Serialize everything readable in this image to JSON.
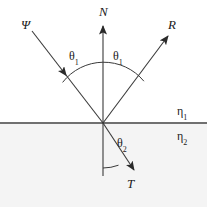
{
  "figure": {
    "background_color": "#ffffff",
    "lower_medium_fill": "#f4f4f4",
    "line_color": "#3a3a3a",
    "interface_color": "#707070",
    "text_color": "#1a1a1a",
    "width": 207,
    "height": 207
  },
  "labels": {
    "incident_ray": "Ψ",
    "normal": "N",
    "reflected_ray": "R",
    "transmitted_ray": "T",
    "angle_incidence": "θ",
    "angle_incidence_sub": "1",
    "angle_reflection": "θ",
    "angle_reflection_sub": "1",
    "angle_refraction": "θ",
    "angle_refraction_sub": "2",
    "index_upper": "η",
    "index_upper_sub": "1",
    "index_lower": "η",
    "index_lower_sub": "2"
  },
  "geometry": {
    "vertex_x": 103,
    "vertex_y": 123,
    "interface_y": 123,
    "normal_top_y": 22,
    "normal_bottom_y": 176,
    "incident_start_x": 32,
    "incident_start_y": 31,
    "reflected_end_x": 172,
    "reflected_end_y": 32,
    "transmitted_end_x": 138,
    "transmitted_end_y": 174,
    "upper_arc_radius": 52,
    "lower_arc_radius": 48,
    "angle_incidence_deg": 37,
    "angle_reflection_deg": 37,
    "angle_refraction_deg": 20
  }
}
